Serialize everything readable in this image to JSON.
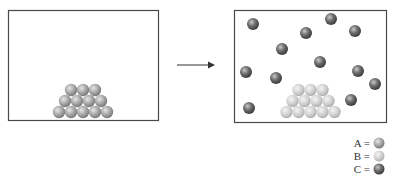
{
  "diagram": {
    "colors": {
      "A": "#a9a9a9",
      "B": "#d4d4d4",
      "C": "#6e6e6e",
      "frame": "#4a4a4a",
      "arrow": "#333333"
    },
    "left_panel": {
      "label": "before",
      "particles_A_pyramid_rows": [
        3,
        4,
        5
      ]
    },
    "right_panel": {
      "label": "after",
      "particles_B_pyramid_rows": [
        3,
        4,
        5
      ],
      "particles_C_count": 12
    },
    "arrow": "reaction-arrow",
    "legend": [
      {
        "key": "A",
        "text": "A =",
        "species": "A"
      },
      {
        "key": "B",
        "text": "B =",
        "species": "B"
      },
      {
        "key": "C",
        "text": "C =",
        "species": "C"
      }
    ]
  }
}
